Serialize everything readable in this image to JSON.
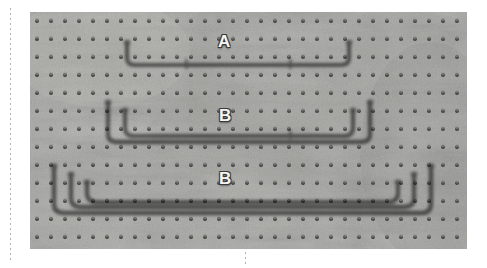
{
  "figure": {
    "caption_labels": [
      {
        "id": "a",
        "text": "A"
      },
      {
        "id": "b1",
        "text": "B"
      },
      {
        "id": "b2",
        "text": "B"
      }
    ],
    "scene": {
      "background_surface": "pegboard",
      "background_color": "#9b9b98",
      "hole_color": "#2b2b29",
      "hardware_color": "#f2f2ef",
      "hardware_shadow_color": "#6f6f6c"
    },
    "pegboard": {
      "hole_columns": 30,
      "hole_rows": 13,
      "hole_spacing_x": 14,
      "hole_spacing_y": 18,
      "hole_radius": 1.9
    },
    "groups": [
      {
        "label": "A",
        "count": 1,
        "bars": [
          {
            "left": 95,
            "right": 318,
            "top": 28,
            "bottom": 52
          }
        ]
      },
      {
        "label": "B",
        "count": 2,
        "bars": [
          {
            "left": 75,
            "right": 340,
            "top": 88,
            "bottom": 128
          },
          {
            "left": 92,
            "right": 324,
            "top": 96,
            "bottom": 122
          }
        ]
      },
      {
        "label": "B",
        "count": 3,
        "bars": [
          {
            "left": 22,
            "right": 400,
            "top": 152,
            "bottom": 198
          },
          {
            "left": 38,
            "right": 384,
            "top": 160,
            "bottom": 192
          },
          {
            "left": 54,
            "right": 368,
            "top": 168,
            "bottom": 187
          }
        ]
      }
    ]
  }
}
